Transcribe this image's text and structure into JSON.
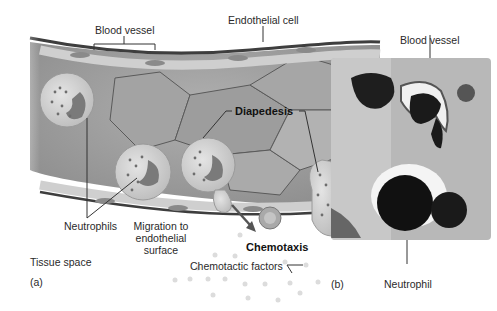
{
  "figure": {
    "panel_a": {
      "panel_label": "(a)",
      "labels": {
        "blood_vessel": "Blood vessel",
        "endothelial_cell": "Endothelial cell",
        "diapedesis": "Diapedesis",
        "neutrophils": "Neutrophils",
        "migration_line1": "Migration to",
        "migration_line2": "endothelial",
        "migration_line3": "surface",
        "chemotaxis": "Chemotaxis",
        "chemotactic_factors": "Chemotactic factors",
        "tissue_space": "Tissue space"
      }
    },
    "panel_b": {
      "panel_label": "(b)",
      "labels": {
        "blood_vessel": "Blood vessel",
        "neutrophil": "Neutrophil"
      }
    },
    "colors": {
      "vessel_fill": "#9a9a9a",
      "cell_fill": "#d4d4d4",
      "nucleus": "#7a7a7a",
      "micrograph_dark": "#1a1a1a",
      "micrograph_bg": "#b8b8b8"
    }
  }
}
